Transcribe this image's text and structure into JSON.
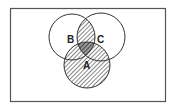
{
  "diagram": {
    "type": "venn",
    "universe_label": "",
    "sets": [
      {
        "id": "A",
        "label": "A"
      },
      {
        "id": "B",
        "label": "B"
      },
      {
        "id": "C",
        "label": "C"
      }
    ],
    "shaded_regions": [
      "A",
      "B∩C"
    ],
    "double_shaded_regions": [
      "A∩B∩C"
    ],
    "colors": {
      "stroke": "#333333",
      "hatch": "#444444",
      "background": "#ffffff"
    }
  }
}
